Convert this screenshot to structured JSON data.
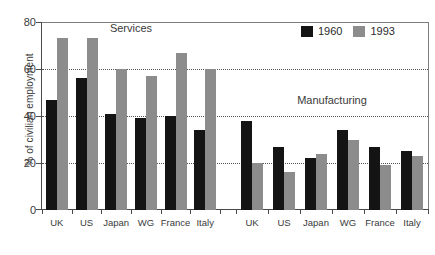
{
  "chart_data": {
    "type": "bar",
    "title": "",
    "xlabel": "",
    "ylabel": "% of civilian employment",
    "ylim": [
      0,
      80
    ],
    "yticks": [
      0,
      20,
      40,
      60,
      80
    ],
    "grid": "horizontal dotted at 20, 40, 60",
    "legend_position": "top-right",
    "categories": [
      "UK",
      "US",
      "Japan",
      "WG",
      "France",
      "Italy"
    ],
    "panels": [
      {
        "name": "Services",
        "series": [
          {
            "name": "1960",
            "values": [
              47,
              56,
              41,
              39,
              40,
              34
            ]
          },
          {
            "name": "1993",
            "values": [
              73,
              73,
              60,
              57,
              67,
              60
            ]
          }
        ]
      },
      {
        "name": "Manufacturing",
        "series": [
          {
            "name": "1960",
            "values": [
              38,
              27,
              22,
              34,
              27,
              25
            ]
          },
          {
            "name": "1993",
            "values": [
              20,
              16,
              24,
              30,
              19,
              23
            ]
          }
        ]
      }
    ],
    "legend": [
      {
        "label": "1960",
        "color": "#141414"
      },
      {
        "label": "1993",
        "color": "#8c8c8c"
      }
    ]
  },
  "axis": {
    "ylabel": "% of civilian employment",
    "yticks": [
      "80",
      "60",
      "40",
      "20",
      "0"
    ]
  },
  "panel_titles": {
    "services": "Services",
    "manufacturing": "Manufacturing"
  },
  "legend": {
    "item1": "1960",
    "item2": "1993"
  },
  "colors": {
    "series_1960": "#141414",
    "series_1993": "#8c8c8c",
    "axis": "#4a4a4a",
    "grid": "#555555",
    "text": "#3a3a3a"
  }
}
